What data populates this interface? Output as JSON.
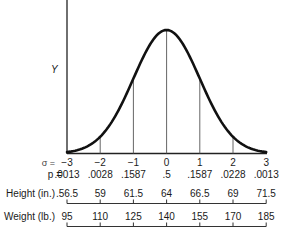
{
  "chart_data": {
    "type": "line",
    "title": "",
    "xlabel": "σ",
    "ylabel": "Y",
    "x": [
      -3,
      -2,
      -1,
      0,
      1,
      2,
      3
    ],
    "series": [
      {
        "name": "Normal density (Y)",
        "x": [
          -3,
          -2.5,
          -2,
          -1.5,
          -1,
          -0.5,
          0,
          0.5,
          1,
          1.5,
          2,
          2.5,
          3
        ],
        "values": [
          0.0044,
          0.0175,
          0.054,
          0.1295,
          0.242,
          0.3521,
          0.3989,
          0.3521,
          0.242,
          0.1295,
          0.054,
          0.0175,
          0.0044
        ]
      }
    ],
    "sigma_labels": [
      "−3",
      "−2",
      "−1",
      "0",
      "1",
      "2",
      "3"
    ],
    "p_values": [
      ".0013",
      ".0028",
      ".1587",
      ".5",
      ".1587",
      ".0228",
      ".0013"
    ],
    "height_in": [
      ".56.5",
      "59",
      "61.5",
      "64",
      "66.5",
      "69",
      "71.5"
    ],
    "weight_lb": [
      "95",
      "110",
      "125",
      "140",
      "155",
      "170",
      "185"
    ],
    "xlim": [
      -3,
      3
    ],
    "grid": false,
    "legend": "none"
  },
  "labels": {
    "y_axis": "Y",
    "sigma_row": "σ =",
    "p_row": "p =",
    "height_row": "Height (in.)",
    "weight_row": "Weight (lb.)"
  }
}
